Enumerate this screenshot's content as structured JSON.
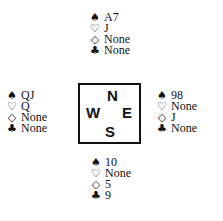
{
  "suits": {
    "spades": "♠",
    "hearts": "♡",
    "diamonds": "◇",
    "clubs": "♣"
  },
  "hands": {
    "north": {
      "spades": "A7",
      "hearts": "J",
      "diamonds": "None",
      "clubs": "None"
    },
    "west": {
      "spades": "QJ",
      "hearts": "Q",
      "diamonds": "None",
      "clubs": "None"
    },
    "east": {
      "spades": "98",
      "hearts": "None",
      "diamonds": "J",
      "clubs": "None"
    },
    "south": {
      "spades": "10",
      "hearts": "None",
      "diamonds": "5",
      "clubs": "9"
    }
  },
  "compass": {
    "n": "N",
    "w": "W",
    "e": "E",
    "s": "S"
  }
}
